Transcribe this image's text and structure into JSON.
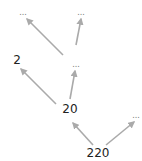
{
  "diagram": {
    "type": "factor-tree",
    "edge_color": "#aaaaaa",
    "nodes": [
      {
        "id": "n220",
        "label": "220",
        "x": 98,
        "y": 153,
        "kind": "num"
      },
      {
        "id": "n20",
        "label": "20",
        "x": 70,
        "y": 109,
        "kind": "num"
      },
      {
        "id": "nRight",
        "label": "...",
        "x": 136,
        "y": 116,
        "kind": "ell"
      },
      {
        "id": "n2",
        "label": "2",
        "x": 17,
        "y": 60,
        "kind": "num"
      },
      {
        "id": "nMid",
        "label": "...",
        "x": 76,
        "y": 65,
        "kind": "ell"
      },
      {
        "id": "nTopLeft",
        "label": "...",
        "x": 23,
        "y": 13,
        "kind": "ell"
      },
      {
        "id": "nTopRight",
        "label": "...",
        "x": 81,
        "y": 13,
        "kind": "ell"
      }
    ],
    "edges": [
      {
        "from": "n220",
        "to": "n20",
        "x1": 93,
        "y1": 145,
        "x2": 73,
        "y2": 123
      },
      {
        "from": "n220",
        "to": "nRight",
        "x1": 106,
        "y1": 145,
        "x2": 134,
        "y2": 122
      },
      {
        "from": "n20",
        "to": "n2",
        "x1": 56,
        "y1": 104,
        "x2": 21,
        "y2": 69
      },
      {
        "from": "n20",
        "to": "nMid",
        "x1": 70,
        "y1": 99,
        "x2": 75,
        "y2": 71
      },
      {
        "from": "nMid",
        "to": "nTopLeft",
        "x1": 63,
        "y1": 55,
        "x2": 27,
        "y2": 19
      },
      {
        "from": "nMid",
        "to": "nTopRight",
        "x1": 76,
        "y1": 45,
        "x2": 81,
        "y2": 19
      }
    ]
  }
}
